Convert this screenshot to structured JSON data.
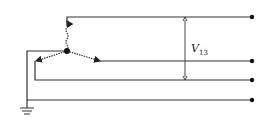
{
  "diagram": {
    "type": "three-phase wye source with neutral and ground",
    "voltage_label": {
      "symbol": "V",
      "subscript": "13"
    },
    "terminals": [
      "line-1",
      "line-2",
      "line-3",
      "neutral"
    ],
    "colors": {
      "line": "#333333",
      "background": "#ffffff"
    }
  }
}
